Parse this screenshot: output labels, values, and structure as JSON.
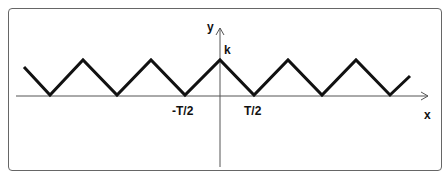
{
  "diagram": {
    "type": "triangle-wave",
    "axes": {
      "x_label": "x",
      "y_label": "y"
    },
    "labels": {
      "amplitude": "k",
      "neg_half_period": "-T/2",
      "pos_half_period": "T/2"
    },
    "colors": {
      "wave": "#111111",
      "axis": "#555555",
      "frame": "#666666"
    }
  }
}
